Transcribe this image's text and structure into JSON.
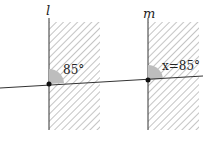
{
  "diagram": {
    "lines": [
      {
        "name": "l",
        "label": "l",
        "x": 49
      },
      {
        "name": "m",
        "label": "m",
        "x": 148
      }
    ],
    "angles": [
      {
        "at": "l",
        "label": "85°"
      },
      {
        "at": "m",
        "label": "x=85°"
      }
    ],
    "colors": {
      "hatch": "#444444",
      "angle_fill": "#bdbdbd",
      "line": "#333333"
    }
  }
}
